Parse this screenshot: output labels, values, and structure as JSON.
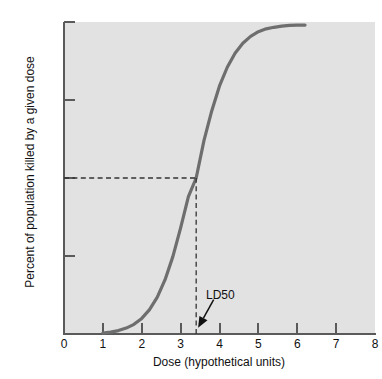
{
  "chart_data": {
    "type": "line",
    "title": "",
    "subtitle": "",
    "xlabel": "Dose (hypothetical units)",
    "ylabel": "Percent of population killed by a given dose",
    "xlim": [
      0,
      8
    ],
    "ylim": [
      0,
      100
    ],
    "xticks": [
      "0",
      "1",
      "2",
      "3",
      "4",
      "5",
      "6",
      "7",
      "8"
    ],
    "xtick_values": [
      0,
      1,
      2,
      3,
      4,
      5,
      6,
      7,
      8
    ],
    "yticks": [
      "0",
      "25",
      "50",
      "75",
      "100"
    ],
    "ytick_values": [
      0,
      25,
      50,
      75,
      100
    ],
    "grid": false,
    "legend": "none",
    "plot_background": "#e2e2e2",
    "curve_color": "#6e6e6e",
    "axis_color": "#5a5a5a",
    "series": [
      {
        "name": "Dose-response curve",
        "x": [
          1.0,
          1.2,
          1.4,
          1.6,
          1.8,
          2.0,
          2.2,
          2.4,
          2.6,
          2.8,
          3.0,
          3.2,
          3.4,
          3.6,
          3.8,
          4.0,
          4.2,
          4.4,
          4.6,
          4.8,
          5.0,
          5.2,
          5.4,
          5.6,
          5.8,
          6.0,
          6.2
        ],
        "y": [
          0.3,
          0.6,
          1.1,
          1.9,
          3.1,
          5.0,
          7.8,
          11.8,
          17.4,
          24.8,
          34.0,
          44.0,
          50.0,
          62.0,
          71.5,
          79.5,
          85.5,
          90.0,
          93.2,
          95.4,
          96.9,
          97.8,
          98.3,
          98.7,
          98.9,
          99.0,
          99.0
        ]
      }
    ],
    "annotations": [
      {
        "label": "LD50",
        "dose": 3.4,
        "percent": 50,
        "guide_horizontal": {
          "from_x": 0,
          "to_x": 3.4,
          "y": 50,
          "style": "dashed"
        },
        "guide_vertical": {
          "x": 3.4,
          "from_y": 0,
          "to_y": 50,
          "style": "dashed"
        },
        "arrow": {
          "from_x": 3.85,
          "from_y": 11,
          "to_x": 3.45,
          "to_y": 2
        }
      }
    ]
  },
  "axis": {
    "x_title": "Dose (hypothetical units)",
    "y_title": "Percent of population killed by a given dose"
  },
  "annotation": {
    "ld50_label": "LD50"
  }
}
